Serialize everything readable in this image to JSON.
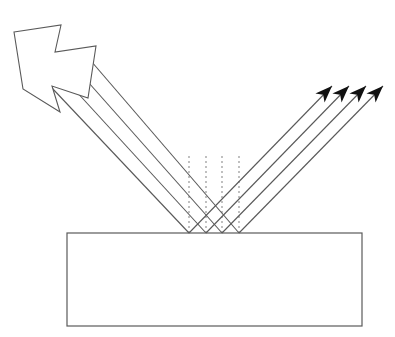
{
  "figure": {
    "background_color": "#ffffff",
    "width": 395,
    "height": 337
  },
  "style": {
    "line_color": "#595959",
    "line_width": 1.1,
    "slab_stroke_color": "#5a5a5a",
    "slab_fill_color": "#ffffff",
    "slab_stroke_width": 1.2,
    "normal_color": "#8c8c8c",
    "normal_width": 1.1,
    "normal_dash": "2,3",
    "arrowhead_fill_color": "#111111",
    "source_arrow_stroke": "#595959",
    "source_arrow_fill": "#ffffff"
  },
  "labels": {
    "incident_beam": "incident beam",
    "reflected_beam": "reflected beam",
    "surface": "reflecting surface",
    "normal": "surface normal"
  },
  "chart_data": {
    "type": "diagram",
    "surface": {
      "name": "reflecting-slab",
      "shape": "rectangle",
      "x": 67,
      "y": 233,
      "width": 295,
      "height": 93,
      "top_surface_y": 233
    },
    "source_arrow": {
      "name": "source-arrow",
      "description": "hollow arrow glyph indicating the light source direction",
      "points": "14,32 61,25 55,52 96,46 88,98 52,86 60,112 23,89",
      "direction_degrees": -45
    },
    "reflection_points": [
      {
        "index": 1,
        "x": 189,
        "y": 233
      },
      {
        "index": 2,
        "x": 206,
        "y": 233
      },
      {
        "index": 3,
        "x": 222,
        "y": 233
      },
      {
        "index": 4,
        "x": 239,
        "y": 233
      }
    ],
    "normals": [
      {
        "index": 1,
        "x": 189,
        "y_top": 156,
        "y_bottom": 233
      },
      {
        "index": 2,
        "x": 206,
        "y_top": 156,
        "y_bottom": 233
      },
      {
        "index": 3,
        "x": 222,
        "y_top": 156,
        "y_bottom": 233
      },
      {
        "index": 4,
        "x": 239,
        "y_top": 156,
        "y_bottom": 233
      }
    ],
    "incident_rays": [
      {
        "index": 1,
        "x1": 52,
        "y1": 88,
        "x2": 189,
        "y2": 233
      },
      {
        "index": 2,
        "x1": 63,
        "y1": 77,
        "x2": 206,
        "y2": 233
      },
      {
        "index": 3,
        "x1": 73,
        "y1": 65,
        "x2": 222,
        "y2": 233
      },
      {
        "index": 4,
        "x1": 85,
        "y1": 54,
        "x2": 239,
        "y2": 233
      }
    ],
    "reflected_rays": [
      {
        "index": 1,
        "x1": 189,
        "y1": 233,
        "x2": 332,
        "y2": 86,
        "tip_x": 332,
        "tip_y": 86
      },
      {
        "index": 2,
        "x1": 206,
        "y1": 233,
        "x2": 349,
        "y2": 86,
        "tip_x": 349,
        "tip_y": 86
      },
      {
        "index": 3,
        "x1": 222,
        "y1": 233,
        "x2": 366,
        "y2": 86,
        "tip_x": 366,
        "tip_y": 86
      },
      {
        "index": 4,
        "x1": 239,
        "y1": 233,
        "x2": 383,
        "y2": 86,
        "tip_x": 383,
        "tip_y": 86
      }
    ],
    "arrowheads": [
      {
        "index": 1,
        "tip_x": 332,
        "tip_y": 86,
        "angle_degrees": -45
      },
      {
        "index": 2,
        "tip_x": 349,
        "tip_y": 86,
        "angle_degrees": -45
      },
      {
        "index": 3,
        "tip_x": 366,
        "tip_y": 86,
        "angle_degrees": -45
      },
      {
        "index": 4,
        "tip_x": 383,
        "tip_y": 86,
        "angle_degrees": -45
      }
    ],
    "angles": {
      "angle_of_incidence_degrees": 45,
      "angle_of_reflection_degrees": 45
    },
    "ray_count": 4
  }
}
